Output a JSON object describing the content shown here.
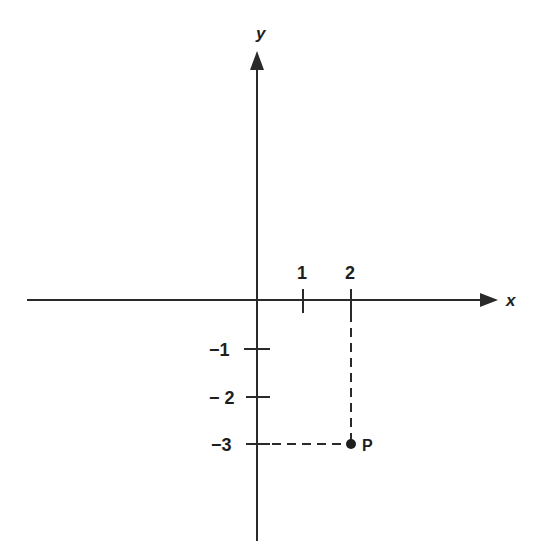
{
  "diagram": {
    "type": "cartesian-plane",
    "axes": {
      "x_label": "x",
      "y_label": "y"
    },
    "x_ticks": [
      {
        "value": 1,
        "label": "1"
      },
      {
        "value": 2,
        "label": "2"
      }
    ],
    "y_ticks": [
      {
        "value": -1,
        "label": "−1"
      },
      {
        "value": -2,
        "label": "− 2"
      },
      {
        "value": -3,
        "label": "−3"
      }
    ],
    "point": {
      "label": "P",
      "x": 2,
      "y": -3
    },
    "guides": "dashed projection lines from P to x = 2 on the x-axis and y = -3 on the y-axis"
  }
}
